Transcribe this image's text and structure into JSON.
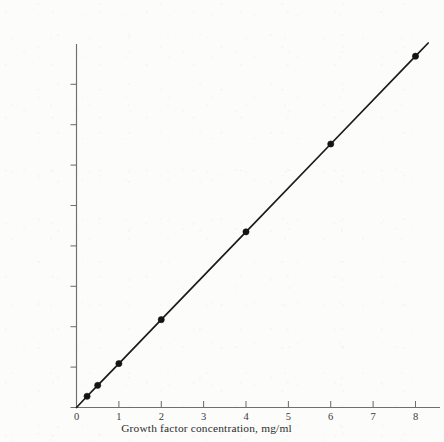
{
  "chart_data": {
    "type": "line",
    "title": "",
    "xlabel": "Growth factor concentration, mg/ml",
    "ylabel": "Cell number or mass at stationary phase",
    "xlim": [
      0,
      8.6
    ],
    "ylim": [
      0,
      1.06
    ],
    "grid": false,
    "legend": null,
    "x_ticks": [
      0,
      1,
      2,
      3,
      4,
      5,
      6,
      7,
      8
    ],
    "x_tick_labels": [
      "0",
      "1",
      "2",
      "3",
      "4",
      "5",
      "6",
      "7",
      "8"
    ],
    "y_ticks": [
      0.0,
      0.115,
      0.23,
      0.345,
      0.46,
      0.575,
      0.69,
      0.805,
      0.92
    ],
    "y_tick_labels": [
      "",
      "",
      "",
      "",
      "",
      "",
      "",
      "",
      ""
    ],
    "series": [
      {
        "name": "Cell yield vs growth factor",
        "x": [
          0.25,
          0.5,
          1.0,
          2.0,
          4.0,
          6.0,
          8.0
        ],
        "y": [
          0.032,
          0.063,
          0.125,
          0.25,
          0.5,
          0.75,
          1.0
        ],
        "marker": "filled-circle",
        "line_color": "#141414",
        "marker_color": "#141414"
      }
    ],
    "annotations": []
  },
  "axis_title": {
    "x": "Growth factor concentration, mg/ml",
    "y": "Cell number or mass at stationary phase"
  },
  "colors": {
    "background": "#fcfcfb",
    "axis": "#6f6f6f",
    "data": "#141414",
    "tick_text": "#3a3a3a"
  }
}
